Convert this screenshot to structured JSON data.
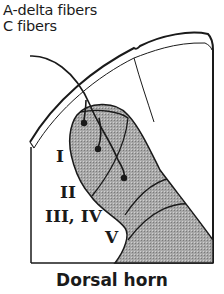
{
  "legend": {
    "line1": "A-delta fibers",
    "line2": "C fibers"
  },
  "laminae": {
    "l1": "I",
    "l2": "II",
    "l3_4": "III, IV",
    "l5": "V"
  },
  "caption": "Dorsal horn",
  "colors": {
    "ink": "#1a1a1a",
    "shading": "#9a9a9a",
    "background": "#ffffff"
  }
}
